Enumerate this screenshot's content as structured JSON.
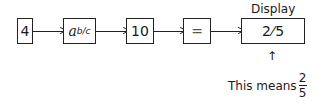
{
  "steps": [
    {
      "key": "4"
    },
    {
      "key_base": "a",
      "key_exp": "b/c"
    },
    {
      "key": "10"
    },
    {
      "key": "="
    }
  ],
  "display": {
    "title": "Display",
    "numerator": "2",
    "separator": "⁀/",
    "denominator": "5"
  },
  "annotation": {
    "arrow": "↑",
    "text": "This means",
    "numerator": "2",
    "denominator": "5"
  }
}
